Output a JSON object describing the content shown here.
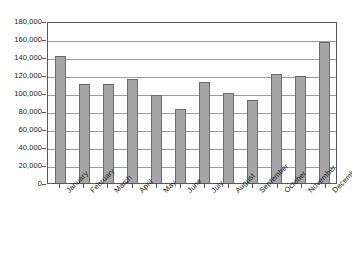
{
  "chart_data": {
    "type": "bar",
    "title": "",
    "subtitle": "",
    "xlabel": "",
    "ylabel": "",
    "categories": [
      "January",
      "February",
      "March",
      "April",
      "May",
      "June",
      "July",
      "August",
      "September",
      "October",
      "November",
      "December"
    ],
    "values": [
      141000,
      110000,
      110000,
      116000,
      98000,
      82000,
      112000,
      100000,
      92000,
      121000,
      119000,
      157000
    ],
    "series": [
      {
        "name": "Monthly total",
        "values": [
          141000,
          110000,
          110000,
          116000,
          98000,
          82000,
          112000,
          100000,
          92000,
          121000,
          119000,
          157000
        ]
      }
    ],
    "ylim": [
      0,
      180000
    ],
    "ytick_step": 20000,
    "ytick_labels": [
      "0",
      "20,000",
      "40,000",
      "60,000",
      "80,000",
      "100,000",
      "120,000",
      "140,000",
      "160,000",
      "180,000"
    ],
    "ytick_values": [
      0,
      20000,
      40000,
      60000,
      80000,
      100000,
      120000,
      140000,
      160000,
      180000
    ],
    "grid": true,
    "grid_axis": "y",
    "legend": false,
    "legend_position": "none",
    "bar_color": "#a6a6a6",
    "bar_border_color": "#6b6b6d",
    "grid_color": "#9a9a9c",
    "axis_color": "#58585a",
    "background_color": "#ffffff",
    "text_color": "#1a1a1a",
    "xtick_label_rotation": -45
  }
}
